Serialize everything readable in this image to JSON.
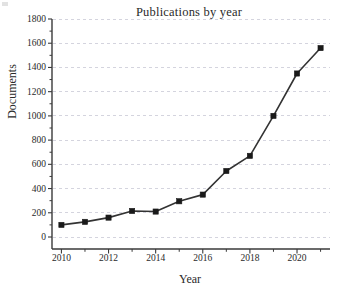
{
  "chart_data": {
    "type": "line",
    "title": "Publications by year",
    "xlabel": "Year",
    "ylabel": "Documents",
    "x": [
      2010,
      2011,
      2012,
      2013,
      2014,
      2015,
      2016,
      2017,
      2018,
      2019,
      2020,
      2021
    ],
    "values": [
      100,
      125,
      160,
      215,
      210,
      295,
      350,
      545,
      670,
      1000,
      1350,
      1560
    ],
    "series": [
      {
        "name": "Documents",
        "values": [
          100,
          125,
          160,
          215,
          210,
          295,
          350,
          545,
          670,
          1000,
          1350,
          1560
        ]
      }
    ],
    "xlim": [
      2009.6,
      2021.4
    ],
    "ylim": [
      0,
      1800
    ],
    "ytick_labels": [
      "0",
      "200",
      "400",
      "600",
      "800",
      "1000",
      "1200",
      "1400",
      "1600",
      "1800"
    ],
    "ytick_values": [
      0,
      200,
      400,
      600,
      800,
      1000,
      1200,
      1400,
      1600,
      1800
    ],
    "xtick_labels": [
      "2010",
      "2012",
      "2014",
      "2016",
      "2018",
      "2020"
    ],
    "xtick_values": [
      2010,
      2012,
      2014,
      2016,
      2018,
      2020
    ],
    "xminor_values": [
      2011,
      2013,
      2015,
      2017,
      2019,
      2021
    ],
    "grid": "horizontal-dashed",
    "legend": "none",
    "marker": "square",
    "line_color": "#333333",
    "marker_color": "#1a1a1a",
    "grid_color": "#c9c9d6",
    "axis_color": "#3a3a3a",
    "background_color": "#ffffff"
  }
}
